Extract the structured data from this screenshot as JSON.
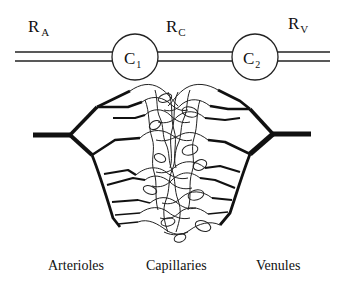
{
  "circuit": {
    "resistors": [
      {
        "symbol": "R",
        "subscript": "A"
      },
      {
        "symbol": "R",
        "subscript": "C"
      },
      {
        "symbol": "R",
        "subscript": "V"
      }
    ],
    "capacitors": [
      {
        "symbol": "C",
        "subscript": "1"
      },
      {
        "symbol": "C",
        "subscript": "2"
      }
    ]
  },
  "network": {
    "labels": [
      "Arterioles",
      "Capillaries",
      "Venules"
    ]
  },
  "colors": {
    "line": "#111111",
    "background": "#ffffff"
  }
}
